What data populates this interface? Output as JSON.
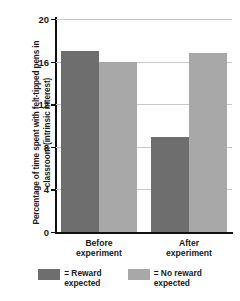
{
  "chart_data": {
    "type": "bar",
    "title": "",
    "xlabel": "",
    "ylabel": "Percentage of time spent with felt-tipped pens in classroom (intrinsic interest)",
    "categories": [
      "Before experiment",
      "After experiment"
    ],
    "series": [
      {
        "name": "= Reward expected",
        "values": [
          17.0,
          8.9
        ],
        "color": "#6e6e6e"
      },
      {
        "name": "= No reward expected",
        "values": [
          16.0,
          16.8
        ],
        "color": "#a8a8a8"
      }
    ],
    "ylim": [
      0,
      20
    ],
    "yticks": [
      0,
      4,
      8,
      12,
      16,
      20
    ],
    "ytick_labels": [
      "0",
      "4",
      "8",
      "12",
      "16",
      "20"
    ],
    "grid": true,
    "legend_position": "bottom"
  },
  "legend": {
    "items": [
      {
        "label": "= Reward\nexpected",
        "color": "#6e6e6e"
      },
      {
        "label": "= No reward\nexpected",
        "color": "#a8a8a8"
      }
    ]
  },
  "colors": {
    "reward_expected": "#6e6e6e",
    "no_reward_expected": "#a8a8a8",
    "axis": "#101010",
    "grid": "#c9c9c9",
    "background": "#ffffff"
  }
}
